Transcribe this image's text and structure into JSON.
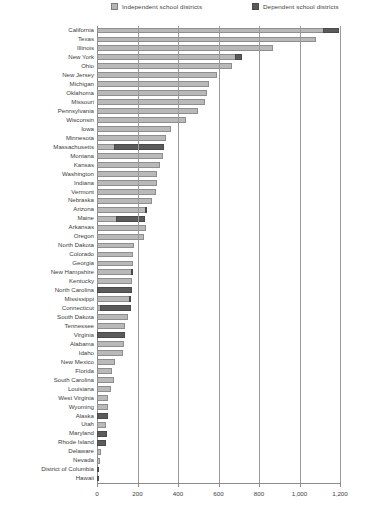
{
  "legend": {
    "independent_label": "Independent school districts",
    "dependent_label": "Dependent school districts",
    "independent_color": "#b9b9b9",
    "dependent_color": "#5b5b5b"
  },
  "axis": {
    "ticks": [
      "0",
      "200",
      "400",
      "600",
      "800",
      "1,000",
      "1,200"
    ]
  },
  "chart_data": {
    "type": "bar",
    "orientation": "horizontal",
    "stacked": true,
    "title": "",
    "xlabel": "",
    "ylabel": "",
    "xlim": [
      0,
      1200
    ],
    "grid": true,
    "legend_position": "top",
    "series": [
      {
        "name": "Independent school districts",
        "color": "#b9b9b9"
      },
      {
        "name": "Dependent school districts",
        "color": "#5b5b5b"
      }
    ],
    "categories": [
      "California",
      "Texas",
      "Illinois",
      "New York",
      "Ohio",
      "New Jersey",
      "Michigan",
      "Oklahoma",
      "Missouri",
      "Pennsylvania",
      "Wisconsin",
      "Iowa",
      "Minnesota",
      "Massachusetts",
      "Montana",
      "Kansas",
      "Washington",
      "Indiana",
      "Vermont",
      "Nebraska",
      "Arizona",
      "Maine",
      "Arkansas",
      "Oregon",
      "North Dakota",
      "Colorado",
      "Georgia",
      "New Hampshire",
      "Kentucky",
      "North Carolina",
      "Mississippi",
      "Connecticut",
      "South Dakota",
      "Tennessee",
      "Virginia",
      "Alabama",
      "Idaho",
      "New Mexico",
      "Florida",
      "South Carolina",
      "Louisiana",
      "West Virginia",
      "Wyoming",
      "Alaska",
      "Utah",
      "Maryland",
      "Rhode Island",
      "Delaware",
      "Nevada",
      "District of Columbia",
      "Hawaii"
    ],
    "independent": [
      1115,
      1080,
      870,
      680,
      665,
      595,
      555,
      545,
      535,
      500,
      440,
      365,
      340,
      85,
      325,
      310,
      295,
      295,
      290,
      270,
      235,
      95,
      240,
      230,
      185,
      180,
      180,
      170,
      175,
      0,
      160,
      17,
      155,
      137,
      0,
      132,
      126,
      90,
      75,
      85,
      70,
      55,
      55,
      0,
      42,
      0,
      0,
      19,
      17,
      0,
      0
    ],
    "dependent": [
      80,
      0,
      0,
      35,
      0,
      0,
      0,
      0,
      0,
      0,
      0,
      0,
      0,
      245,
      0,
      0,
      0,
      0,
      0,
      0,
      12,
      140,
      0,
      0,
      0,
      0,
      0,
      8,
      0,
      175,
      5,
      150,
      0,
      0,
      136,
      0,
      0,
      0,
      0,
      0,
      0,
      0,
      0,
      53,
      0,
      50,
      45,
      0,
      0,
      1,
      1
    ]
  }
}
